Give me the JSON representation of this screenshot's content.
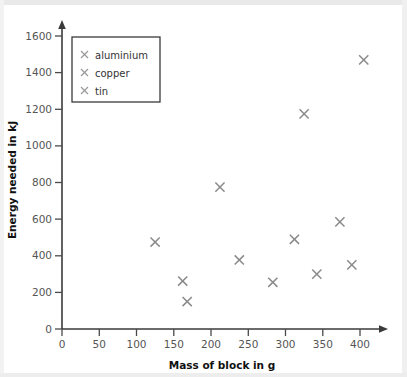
{
  "chart_data": {
    "type": "scatter",
    "title": "",
    "xlabel": "Mass of block in g",
    "ylabel": "Energy needed in kJ",
    "xlim": [
      0,
      430
    ],
    "ylim": [
      0,
      1650
    ],
    "xticks": [
      0,
      50,
      100,
      150,
      200,
      250,
      300,
      350,
      400
    ],
    "yticks": [
      0,
      200,
      400,
      600,
      800,
      1000,
      1200,
      1400,
      1600
    ],
    "xtick_labels": [
      "0",
      "50",
      "100",
      "150",
      "200",
      "250",
      "300",
      "350",
      "400"
    ],
    "ytick_labels": [
      "0",
      "200",
      "400",
      "600",
      "800",
      "1000",
      "1200",
      "1400",
      "1600"
    ],
    "grid": false,
    "legend_position": "upper-left",
    "marker_style": "x",
    "marker_color": "#8a8a8a",
    "series": [
      {
        "name": "aluminium",
        "marker": "x",
        "color": "#8a8a8a",
        "points": [
          {
            "x": 125,
            "y": 475
          },
          {
            "x": 212,
            "y": 775
          },
          {
            "x": 325,
            "y": 1175
          },
          {
            "x": 405,
            "y": 1470
          }
        ]
      },
      {
        "name": "copper",
        "marker": "x",
        "color": "#8a8a8a",
        "points": [
          {
            "x": 168,
            "y": 150
          },
          {
            "x": 283,
            "y": 255
          },
          {
            "x": 342,
            "y": 300
          },
          {
            "x": 389,
            "y": 350
          }
        ]
      },
      {
        "name": "tin",
        "marker": "x",
        "color": "#8a8a8a",
        "points": [
          {
            "x": 162,
            "y": 262
          },
          {
            "x": 238,
            "y": 377
          },
          {
            "x": 312,
            "y": 490
          },
          {
            "x": 373,
            "y": 585
          }
        ]
      }
    ],
    "all_points": [
      {
        "x": 125,
        "y": 475
      },
      {
        "x": 162,
        "y": 262
      },
      {
        "x": 168,
        "y": 150
      },
      {
        "x": 212,
        "y": 775
      },
      {
        "x": 238,
        "y": 377
      },
      {
        "x": 283,
        "y": 255
      },
      {
        "x": 312,
        "y": 490
      },
      {
        "x": 325,
        "y": 1175
      },
      {
        "x": 342,
        "y": 300
      },
      {
        "x": 373,
        "y": 585
      },
      {
        "x": 389,
        "y": 350
      },
      {
        "x": 405,
        "y": 1470
      }
    ]
  },
  "legend": {
    "items": [
      {
        "label": "aluminium"
      },
      {
        "label": "copper"
      },
      {
        "label": "tin"
      }
    ]
  },
  "axes": {
    "x_title": "Mass of block in g",
    "y_title": "Energy needed in kJ"
  }
}
